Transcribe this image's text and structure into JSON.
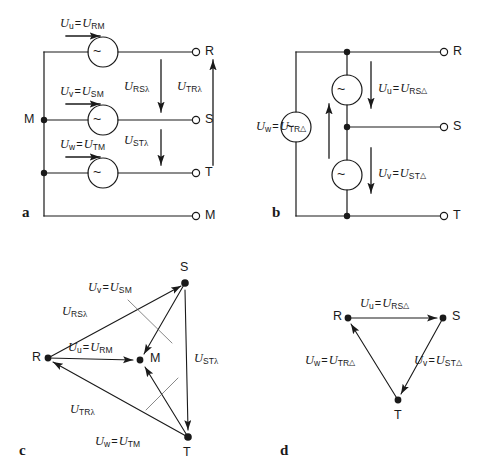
{
  "figure": {
    "stroke_color": "#1a1a1a",
    "background_color": "#ffffff"
  },
  "panels": [
    {
      "id": "a",
      "label": "a",
      "name": "star-connection-circuit",
      "description": "Star (wye) connected three-phase source with neutral point M",
      "terminals": [
        {
          "name": "M",
          "label": "M",
          "position": "left"
        },
        {
          "name": "R",
          "label": "R",
          "position": "right-top"
        },
        {
          "name": "S",
          "label": "S",
          "position": "right-middle"
        },
        {
          "name": "T",
          "label": "T",
          "position": "right-bottom"
        },
        {
          "name": "M2",
          "label": "M",
          "position": "right-bottom-neutral"
        }
      ],
      "sources": [
        {
          "symbol": "~",
          "name": "ac-source-u"
        },
        {
          "symbol": "~",
          "name": "ac-source-v"
        },
        {
          "symbol": "~",
          "name": "ac-source-w"
        }
      ],
      "phase_labels": [
        {
          "name": "phase-u",
          "var": "U",
          "var_sub": "u",
          "eq": "=",
          "val": "U",
          "val_sub": "RM",
          "mode": ""
        },
        {
          "name": "phase-v",
          "var": "U",
          "var_sub": "v",
          "eq": "=",
          "val": "U",
          "val_sub": "SM",
          "mode": ""
        },
        {
          "name": "phase-w",
          "var": "U",
          "var_sub": "w",
          "eq": "=",
          "val": "U",
          "val_sub": "TM",
          "mode": ""
        }
      ],
      "line_labels": [
        {
          "name": "line-rs",
          "val": "U",
          "val_sub": "RS",
          "mode": "λ"
        },
        {
          "name": "line-st",
          "val": "U",
          "val_sub": "ST",
          "mode": "λ"
        },
        {
          "name": "line-tr",
          "val": "U",
          "val_sub": "TR",
          "mode": "λ"
        }
      ]
    },
    {
      "id": "b",
      "label": "b",
      "name": "delta-connection-circuit",
      "description": "Delta connected three-phase source",
      "terminals": [
        {
          "name": "R",
          "label": "R",
          "position": "right-top"
        },
        {
          "name": "S",
          "label": "S",
          "position": "right-middle"
        },
        {
          "name": "T",
          "label": "T",
          "position": "right-bottom"
        }
      ],
      "sources": [
        {
          "symbol": "~",
          "name": "ac-source-u"
        },
        {
          "symbol": "~",
          "name": "ac-source-v"
        },
        {
          "symbol": "~",
          "name": "ac-source-w"
        }
      ],
      "phase_labels": [
        {
          "name": "phase-u",
          "var": "U",
          "var_sub": "u",
          "eq": "=",
          "val": "U",
          "val_sub": "RS",
          "mode": "△"
        },
        {
          "name": "phase-v",
          "var": "U",
          "var_sub": "v",
          "eq": "=",
          "val": "U",
          "val_sub": "ST",
          "mode": "△"
        },
        {
          "name": "phase-w",
          "var": "U",
          "var_sub": "w",
          "eq": "=",
          "val": "U",
          "val_sub": "TR",
          "mode": "△"
        }
      ]
    },
    {
      "id": "c",
      "label": "c",
      "name": "star-phasor-diagram",
      "description": "Phasor diagram of star connection showing phase and line voltages",
      "vertices": [
        {
          "name": "R",
          "label": "R",
          "x": 48,
          "y": 358
        },
        {
          "name": "S",
          "label": "S",
          "x": 185,
          "y": 283
        },
        {
          "name": "T",
          "label": "T",
          "x": 188,
          "y": 437
        },
        {
          "name": "M",
          "label": "M",
          "x": 140,
          "y": 360
        }
      ],
      "phasors": [
        {
          "name": "phasor-u",
          "var": "U",
          "var_sub": "u",
          "eq": "=",
          "val": "U",
          "val_sub": "RM",
          "mode": "",
          "from": "R",
          "to": "M"
        },
        {
          "name": "phasor-v",
          "var": "U",
          "var_sub": "v",
          "eq": "=",
          "val": "U",
          "val_sub": "SM",
          "mode": "",
          "from": "S",
          "to": "M"
        },
        {
          "name": "phasor-w",
          "var": "U",
          "var_sub": "w",
          "eq": "=",
          "val": "U",
          "val_sub": "TM",
          "mode": "",
          "from": "T",
          "to": "M"
        },
        {
          "name": "phasor-rs",
          "var": "",
          "var_sub": "",
          "eq": "",
          "val": "U",
          "val_sub": "RS",
          "mode": "λ",
          "from": "R",
          "to": "S"
        },
        {
          "name": "phasor-st",
          "var": "",
          "var_sub": "",
          "eq": "",
          "val": "U",
          "val_sub": "ST",
          "mode": "λ",
          "from": "S",
          "to": "T"
        },
        {
          "name": "phasor-tr",
          "var": "",
          "var_sub": "",
          "eq": "",
          "val": "U",
          "val_sub": "TR",
          "mode": "λ",
          "from": "T",
          "to": "R"
        }
      ]
    },
    {
      "id": "d",
      "label": "d",
      "name": "delta-phasor-diagram",
      "description": "Phasor diagram of delta connection showing line voltages",
      "vertices": [
        {
          "name": "R",
          "label": "R",
          "x": 348,
          "y": 318
        },
        {
          "name": "S",
          "label": "S",
          "x": 443,
          "y": 318
        },
        {
          "name": "T",
          "label": "T",
          "x": 398,
          "y": 400
        }
      ],
      "phasors": [
        {
          "name": "phasor-u",
          "var": "U",
          "var_sub": "u",
          "eq": "=",
          "val": "U",
          "val_sub": "RS",
          "mode": "△",
          "from": "R",
          "to": "S"
        },
        {
          "name": "phasor-v",
          "var": "U",
          "var_sub": "v",
          "eq": "=",
          "val": "U",
          "val_sub": "ST",
          "mode": "△",
          "from": "S",
          "to": "T"
        },
        {
          "name": "phasor-w",
          "var": "U",
          "var_sub": "w",
          "eq": "=",
          "val": "U",
          "val_sub": "TR",
          "mode": "△",
          "from": "T",
          "to": "R"
        }
      ]
    }
  ],
  "text": {
    "panel_a_id": "a",
    "panel_b_id": "b",
    "panel_c_id": "c",
    "panel_d_id": "d",
    "terminal_R": "R",
    "terminal_S": "S",
    "terminal_T": "T",
    "terminal_M": "M",
    "source_symbol": "~",
    "U": "U",
    "equals": "=",
    "sub_u": "u",
    "sub_v": "v",
    "sub_w": "w",
    "sub_RM": "RM",
    "sub_SM": "SM",
    "sub_TM": "TM",
    "sub_RS": "RS",
    "sub_ST": "ST",
    "sub_TR": "TR",
    "lambda": "λ",
    "delta": "△"
  }
}
